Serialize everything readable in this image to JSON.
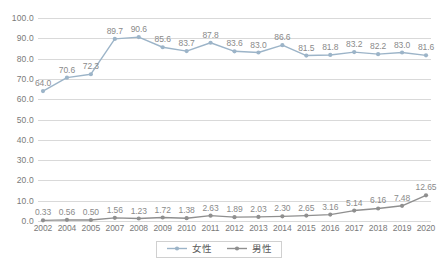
{
  "chart_data": {
    "type": "line",
    "title": "",
    "xlabel": "",
    "ylabel": "",
    "ylim": [
      0,
      100
    ],
    "yticks": [
      "0.0",
      "10.0",
      "20.0",
      "30.0",
      "40.0",
      "50.0",
      "60.0",
      "70.0",
      "80.0",
      "90.0",
      "100.0"
    ],
    "grid": true,
    "legend_position": "bottom-center",
    "categories": [
      "2002",
      "2004",
      "2005",
      "2007",
      "2008",
      "2009",
      "2010",
      "2011",
      "2012",
      "2013",
      "2014",
      "2015",
      "2016",
      "2017",
      "2018",
      "2019",
      "2020"
    ],
    "series": [
      {
        "name": "女性",
        "color": "#9cb4c8",
        "values": [
          64.0,
          70.6,
          72.3,
          89.7,
          90.6,
          85.6,
          83.7,
          87.8,
          83.6,
          83.0,
          86.6,
          81.5,
          81.8,
          83.2,
          82.2,
          83.0,
          81.6
        ],
        "labels": [
          "64.0",
          "70.6",
          "72.3",
          "89.7",
          "90.6",
          "85.6",
          "83.7",
          "87.8",
          "83.6",
          "83.0",
          "86.6",
          "81.5",
          "81.8",
          "83.2",
          "82.2",
          "83.0",
          "81.6"
        ]
      },
      {
        "name": "男性",
        "color": "#8f8f8f",
        "values": [
          0.33,
          0.56,
          0.5,
          1.56,
          1.23,
          1.72,
          1.38,
          2.63,
          1.89,
          2.03,
          2.3,
          2.65,
          3.16,
          5.14,
          6.16,
          7.48,
          12.65
        ],
        "labels": [
          "0.33",
          "0.56",
          "0.50",
          "1.56",
          "1.23",
          "1.72",
          "1.38",
          "2.63",
          "1.89",
          "2.03",
          "2.30",
          "2.65",
          "3.16",
          "5.14",
          "6.16",
          "7.48",
          "12.65"
        ]
      }
    ]
  },
  "legend": {
    "entries": [
      {
        "label": "女性"
      },
      {
        "label": "男性"
      }
    ]
  },
  "colors": {
    "female_line": "#9cb4c8",
    "male_line": "#8f8f8f",
    "gridline": "#d9d9d9",
    "axis_text": "#7a7a7a",
    "label_text": "#8a8a8a",
    "background": "#ffffff"
  }
}
